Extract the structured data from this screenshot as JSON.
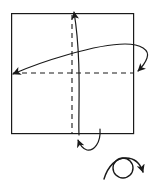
{
  "figure": {
    "kind": "origami-fold-diagram",
    "width": 155,
    "height": 183,
    "background_color": "#ffffff",
    "stroke_color": "#1a1a1a",
    "title": ""
  },
  "sheet": {
    "name": "square-sheet",
    "shape": "square",
    "x": 11,
    "y": 13,
    "width": 123,
    "height": 121,
    "fill_color": "#ffffff",
    "stroke_color": "#1a1a1a",
    "stroke_width": 1.2
  },
  "crease_lines": [
    {
      "name": "horizontal-crease",
      "style": "dashed",
      "orientation": "horizontal",
      "x1": 11,
      "y1": 73,
      "x2": 134,
      "y2": 73,
      "stroke_color": "#1a1a1a",
      "dash": "5 4"
    },
    {
      "name": "vertical-crease",
      "style": "dashed",
      "orientation": "vertical",
      "x1": 72,
      "y1": 13,
      "x2": 72,
      "y2": 134,
      "stroke_color": "#1a1a1a",
      "dash": "5 4"
    }
  ],
  "fold_arrows": [
    {
      "name": "horizontal-fold-arrow",
      "description": "flattened loop sweeping from the left edge up and over to the right, ending in an arrowhead at the right crease end",
      "direction": "left-and-right",
      "arrowheads": 2,
      "stroke_color": "#1a1a1a"
    },
    {
      "name": "vertical-fold-arrow",
      "description": "narrow loop rising from the bottom of the sheet up to the top, ending in an arrowhead above the top edge",
      "direction": "up-and-down",
      "arrowheads": 2,
      "stroke_color": "#1a1a1a"
    }
  ],
  "rotation_symbol": {
    "name": "rotate-symbol",
    "description": "circle with a sweeping arc arrow indicating turn over / rotate",
    "center_x": 123,
    "center_y": 168,
    "radius": 10,
    "stroke_color": "#1a1a1a",
    "label": ""
  }
}
